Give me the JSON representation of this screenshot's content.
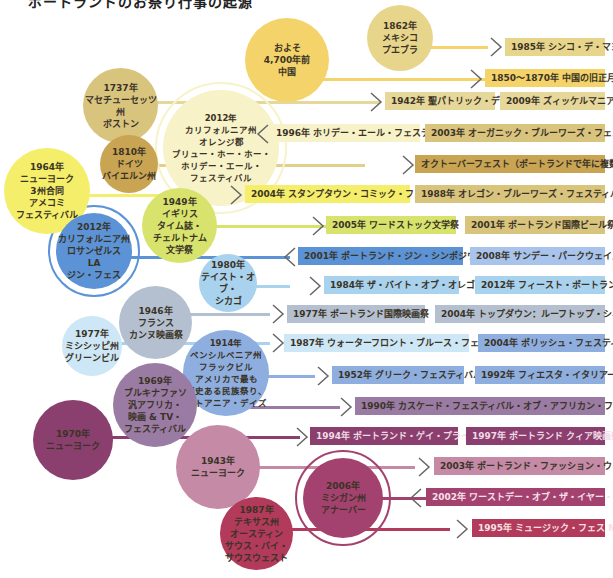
{
  "title": "ポートランドのお祭り行事の起源",
  "colors": {
    "yellow_light": "#f8f2c8",
    "yellow": "#f3d36a",
    "tan": "#d9c47e",
    "ochre": "#c8a453",
    "lemon": "#f4ee6a",
    "lime": "#d8e36e",
    "blue": "#5b93d6",
    "blue_light": "#a8d2ee",
    "slate": "#b4c0d0",
    "periwinkle": "#8eaee0",
    "mauve": "#9a7ba3",
    "plum": "#8a3f6e",
    "rose": "#c48aa6",
    "magenta": "#a4426f",
    "crimson": "#b23a5a"
  },
  "origins": [
    {
      "id": "china",
      "label": "およそ\n4,700年前\n中国"
    },
    {
      "id": "mexico",
      "label": "1862年\nメキシコ\nプエブラ"
    },
    {
      "id": "boston",
      "label": "1737年\nマセチューセッツ州\nボストン"
    },
    {
      "id": "orange",
      "label": "2012年\nカリフォルニア州\nオレンジ郡\nブリュー・ホー・ホー・\nホリデー・エール・\nフェスティバル"
    },
    {
      "id": "germany",
      "label": "1810年\nドイツ\nバイエルン州"
    },
    {
      "id": "nycomics",
      "label": "1964年\nニューヨーク\n3州合同\nアメコミ\nフェスティバル"
    },
    {
      "id": "uk",
      "label": "1949年\nイギリス\nタイム誌・\nチェルトナム\n文学祭"
    },
    {
      "id": "la",
      "label": "2012年\nカリフォルニア州\nロサンゼルス\nLA\nジン・フェス"
    },
    {
      "id": "chicago",
      "label": "1980年\nテイスト・オブ・\nシカゴ"
    },
    {
      "id": "cannes",
      "label": "1946年\nフランス\nカンヌ映画祭"
    },
    {
      "id": "mississippi",
      "label": "1977年\nミシシッピ州\nグリーンビル"
    },
    {
      "id": "penn",
      "label": "1914年\nペンシルベニア州\nフラックビル\nアメリカで最も\n歴史ある民族祭り、\nリトアニア・デイズ"
    },
    {
      "id": "burkina",
      "label": "1969年\nブルキナファソ\n汎アフリカ・\n映画 & TV・\nフェスティバル"
    },
    {
      "id": "ny1970",
      "label": "1970年\nニューヨーク"
    },
    {
      "id": "ny1943",
      "label": "1943年\nニューヨーク"
    },
    {
      "id": "michigan",
      "label": "2006年\nミシガン州\nアナーバー"
    },
    {
      "id": "austin",
      "label": "1987年\nテキサス州\nオースティン\nサウス・バイ・\nサウスウェスト"
    }
  ],
  "events": [
    {
      "label": "1985年 シンコ・デ・マヨ"
    },
    {
      "label": "1850～1870年 中国の旧正月"
    },
    {
      "label": "1942年 聖パトリック・デー"
    },
    {
      "label": "2009年 ズィッケルマニア"
    },
    {
      "label": "1996年 ホリデー・エール・フェスティバル"
    },
    {
      "label": "2003年 オーガニック・ブルーワーズ・フェスティバル"
    },
    {
      "label": "オクトーバーフェスト（ポートランドで年に複数回）"
    },
    {
      "label": "2004年 スタンプタウン・コミック・フェス"
    },
    {
      "label": "1988年 オレゴン・ブルーワーズ・フェスティバル"
    },
    {
      "label": "2005年 ワードストック文学祭"
    },
    {
      "label": "2001年 ポートランド国際ビール祭"
    },
    {
      "label": "2001年 ポートランド・ジン・シンポジウム"
    },
    {
      "label": "2008年 サンデー・パークウェイズ"
    },
    {
      "label": "1984年 ザ・バイト・オブ・オレゴン"
    },
    {
      "label": "2012年 フィースト・ポートランド"
    },
    {
      "label": "1977年 ポートランド国際映画祭"
    },
    {
      "label": "2004年 トップダウン：ルーフトップ・シネマ"
    },
    {
      "label": "1987年 ウォーターフロント・ブルース・フェスティバル"
    },
    {
      "label": "2004年 ポリッシュ・フェスティバル"
    },
    {
      "label": "1952年 グリーク・フェスティバル"
    },
    {
      "label": "1992年 フィエスタ・イタリアーナ"
    },
    {
      "label": "1990年 カスケード・フェスティバル・オブ・アフリカン・フィルムス"
    },
    {
      "label": "1994年 ポートランド・ゲイ・プライド"
    },
    {
      "label": "1997年 ポートランド クィア映画祭"
    },
    {
      "label": "2003年 ポートランド・ファッション・ウィーク"
    },
    {
      "label": "2002年 ワーストデー・オブ・ザ・イヤー・ライド"
    },
    {
      "label": "1995年 ミュージック・フェス NW"
    }
  ]
}
